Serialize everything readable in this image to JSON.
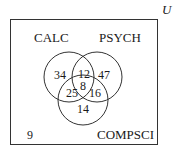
{
  "diagram": {
    "type": "venn-3",
    "universe_label": "U",
    "sets": [
      {
        "name": "CALC"
      },
      {
        "name": "PSYCH"
      },
      {
        "name": "COMPSCI"
      }
    ],
    "regions": {
      "calc_only": "34",
      "psych_only": "47",
      "compsci_only": "14",
      "calc_psych": "12",
      "calc_compsci": "25",
      "psych_compsci": "16",
      "all_three": "8",
      "none": "9"
    }
  }
}
